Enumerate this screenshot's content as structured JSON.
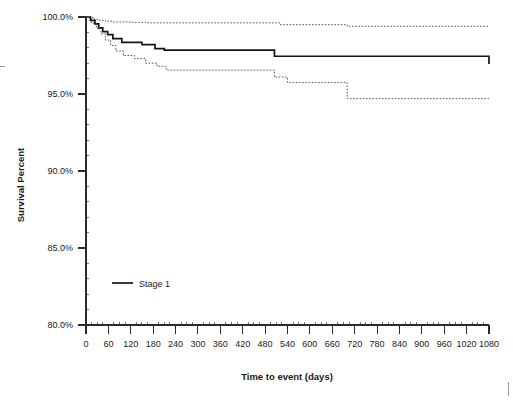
{
  "chart_data": {
    "type": "line",
    "title": "",
    "xlabel": "Time to event (days)",
    "ylabel": "Survival Percent",
    "xlim": [
      0,
      1080
    ],
    "ylim": [
      80.0,
      100.0
    ],
    "grid": false,
    "legend_position": "inside-lower-left",
    "x_tick_labels": [
      "0",
      "60",
      "120",
      "180",
      "240",
      "300",
      "360",
      "420",
      "480",
      "540",
      "600",
      "660",
      "720",
      "780",
      "840",
      "900",
      "960",
      "1020",
      "1080"
    ],
    "x_tick_values": [
      0,
      60,
      120,
      180,
      240,
      300,
      360,
      420,
      480,
      540,
      600,
      660,
      720,
      780,
      840,
      900,
      960,
      1020,
      1080
    ],
    "x_minor_tick_count_between_majors": 3,
    "y_tick_labels": [
      "100.0%",
      "95.0%",
      "90.0%",
      "85.0%",
      "80.0%"
    ],
    "y_tick_values": [
      100.0,
      95.0,
      90.0,
      85.0,
      80.0
    ],
    "series": [
      {
        "name": "Stage 1",
        "style": "solid",
        "color": "#151515",
        "step": "post",
        "x": [
          0,
          12,
          24,
          34,
          45,
          58,
          72,
          96,
          150,
          185,
          210,
          480,
          505,
          665,
          1080
        ],
        "y": [
          100.0,
          99.78,
          99.55,
          99.3,
          99.05,
          98.85,
          98.6,
          98.35,
          98.2,
          97.95,
          97.85,
          97.85,
          97.45,
          97.45,
          96.95
        ]
      },
      {
        "name": "Stage 1 upper 95% CI",
        "style": "dashed",
        "color": "#3a3a3a",
        "step": "post",
        "x": [
          0,
          10,
          22,
          36,
          52,
          70,
          120,
          160,
          480,
          520,
          665,
          700,
          1080
        ],
        "y": [
          100.0,
          99.95,
          99.85,
          99.78,
          99.72,
          99.68,
          99.65,
          99.62,
          99.62,
          99.5,
          99.5,
          99.4,
          99.4
        ]
      },
      {
        "name": "Stage 1 lower 95% CI",
        "style": "dashed",
        "color": "#3a3a3a",
        "step": "post",
        "x": [
          0,
          14,
          28,
          40,
          52,
          66,
          80,
          100,
          130,
          160,
          190,
          215,
          480,
          505,
          540,
          665,
          700,
          1080
        ],
        "y": [
          100.0,
          99.6,
          99.25,
          98.9,
          98.5,
          98.15,
          97.8,
          97.5,
          97.3,
          97.0,
          96.8,
          96.55,
          96.55,
          96.1,
          95.75,
          95.75,
          94.7,
          94.7
        ]
      }
    ],
    "legend": [
      {
        "label": "Stage 1",
        "style": "solid",
        "color": "#151515"
      }
    ]
  },
  "axes": {
    "y_title": "Survival Percent",
    "x_title": "Time to event (days)"
  }
}
